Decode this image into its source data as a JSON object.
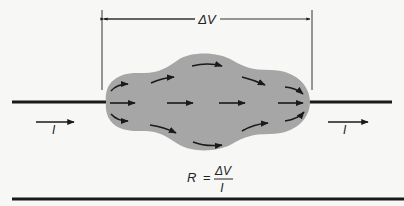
{
  "figure": {
    "voltage_label": "ΔV",
    "current_label_left": "I",
    "current_label_right": "I",
    "formula": {
      "lhs": "R",
      "equals": "=",
      "numerator": "ΔV",
      "denominator": "I"
    },
    "colors": {
      "background": "#f7f7f5",
      "resistor_body": "#a6a6a6",
      "wire": "#1a1a1a",
      "arrow": "#1a1a1a"
    }
  }
}
